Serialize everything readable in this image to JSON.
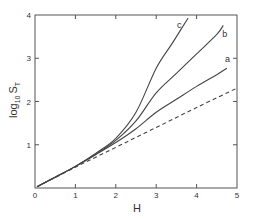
{
  "chart_data": {
    "type": "line",
    "title": "",
    "xlabel": "H",
    "ylabel": "log10 ST",
    "ylabel_parts": {
      "main": "log",
      "sub": "10",
      "var": "S",
      "var_sub": "T"
    },
    "xlim": [
      0,
      5
    ],
    "ylim": [
      0,
      4
    ],
    "xticks": [
      "0",
      "1",
      "2",
      "3",
      "4",
      "5"
    ],
    "yticks": [
      "1",
      "2",
      "3",
      "4"
    ],
    "grid": false,
    "legend": "inline labels at curve ends",
    "series": [
      {
        "name": "a",
        "style": "solid",
        "x": [
          0.05,
          0.5,
          1.0,
          1.5,
          2.0,
          2.5,
          3.0,
          3.5,
          4.0,
          4.5,
          4.75
        ],
        "y": [
          0.03,
          0.25,
          0.5,
          0.77,
          1.05,
          1.37,
          1.75,
          2.05,
          2.35,
          2.62,
          2.77
        ]
      },
      {
        "name": "b",
        "style": "solid",
        "x": [
          0.05,
          0.5,
          1.0,
          1.5,
          2.0,
          2.5,
          3.0,
          3.5,
          4.0,
          4.5,
          4.66
        ],
        "y": [
          0.03,
          0.25,
          0.5,
          0.78,
          1.1,
          1.55,
          2.2,
          2.65,
          3.1,
          3.55,
          3.76
        ]
      },
      {
        "name": "c",
        "style": "solid",
        "x": [
          0.05,
          0.5,
          1.0,
          1.5,
          2.0,
          2.5,
          3.0,
          3.4,
          3.79
        ],
        "y": [
          0.03,
          0.25,
          0.5,
          0.8,
          1.15,
          1.75,
          2.77,
          3.35,
          3.93
        ]
      },
      {
        "name": "dashed",
        "style": "dashed",
        "x": [
          0.05,
          1.0,
          2.0,
          3.0,
          4.0,
          5.0
        ],
        "y": [
          0.03,
          0.48,
          0.94,
          1.4,
          1.86,
          2.31
        ]
      }
    ]
  }
}
